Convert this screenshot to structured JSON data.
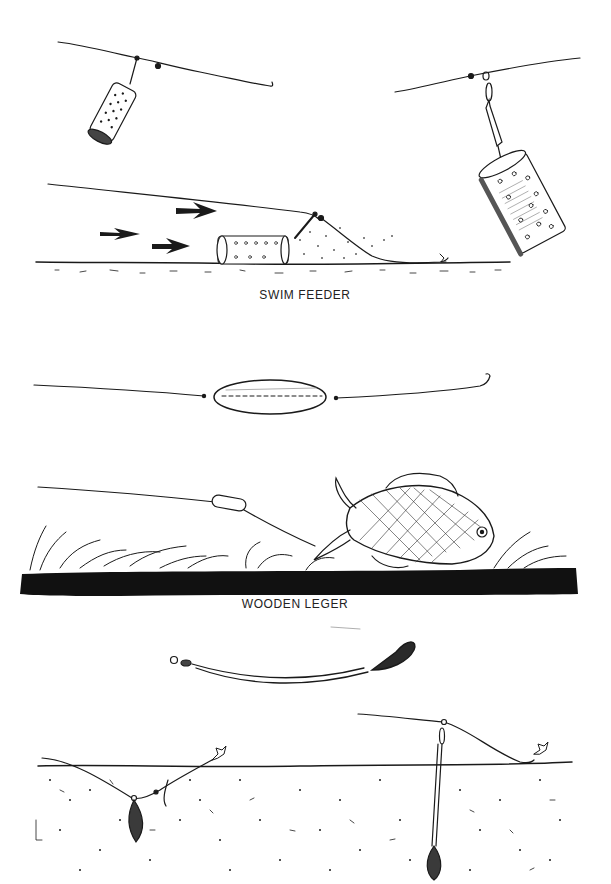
{
  "plate": {
    "background": "#ffffff",
    "ink": "#1a1a1a"
  },
  "sections": [
    {
      "id": "swim-feeder",
      "caption": "SWIM FEEDER",
      "figures": [
        "feeder-on-link-top-left",
        "feeder-on-swivel-top-right",
        "feeder-on-riverbed-with-current-arrows"
      ]
    },
    {
      "id": "wooden-leger",
      "caption": "WOODEN LEGER",
      "figures": [
        "barrel-leger-on-line",
        "leger-with-fish-over-weed"
      ]
    },
    {
      "id": "bomb-leger",
      "caption": "",
      "figures": [
        "arlesey-bomb-on-boom",
        "bomb-in-silt-left",
        "bomb-on-boom-in-silt-right"
      ]
    }
  ]
}
